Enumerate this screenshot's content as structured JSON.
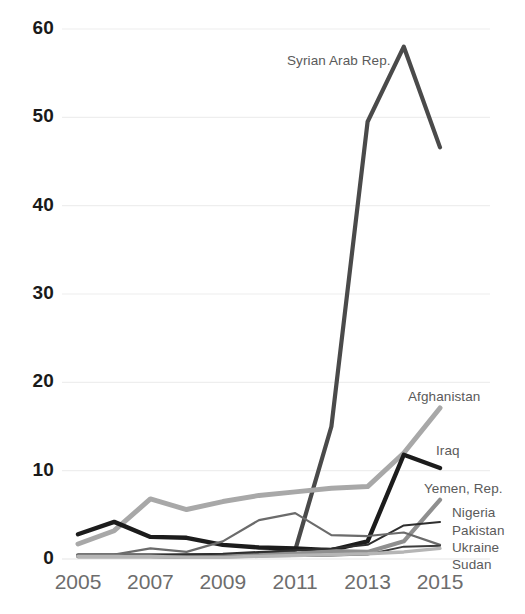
{
  "chart_data": {
    "type": "line",
    "title": "",
    "subtitle": "",
    "xlabel": "",
    "ylabel": "",
    "xlim": [
      2005,
      2015
    ],
    "ylim": [
      0,
      60
    ],
    "grid": true,
    "grid_axis": "y",
    "legend_position": "right-end-labels",
    "x": [
      2005,
      2006,
      2007,
      2008,
      2009,
      2010,
      2011,
      2012,
      2013,
      2014,
      2015
    ],
    "x_tick_labels": [
      "2005",
      "2007",
      "2009",
      "2011",
      "2013",
      "2015"
    ],
    "x_tick_values": [
      2005,
      2007,
      2009,
      2011,
      2013,
      2015
    ],
    "y_tick_labels": [
      "60",
      "50",
      "40",
      "30",
      "20",
      "10",
      "0"
    ],
    "y_tick_values": [
      60,
      50,
      40,
      30,
      20,
      10,
      0
    ],
    "series": [
      {
        "name": "Syrian Arab Rep.",
        "label": "Syrian Arab Rep.",
        "color": "#4a4a4a",
        "width": 4.2,
        "label_x": 287,
        "label_y": 53,
        "values": [
          0.4,
          0.4,
          0.4,
          0.4,
          0.4,
          0.5,
          1.0,
          15.0,
          49.5,
          58.0,
          46.6
        ]
      },
      {
        "name": "Afghanistan",
        "label": "Afghanistan",
        "color": "#a8a8a8",
        "width": 5.0,
        "label_x": 408,
        "label_y": 389,
        "values": [
          1.7,
          3.2,
          6.8,
          5.6,
          6.5,
          7.2,
          7.6,
          8.0,
          8.2,
          12.0,
          17.1
        ]
      },
      {
        "name": "Iraq",
        "label": "Iraq",
        "color": "#1c1c1c",
        "width": 4.4,
        "label_x": 436,
        "label_y": 443,
        "values": [
          2.8,
          4.2,
          2.5,
          2.4,
          1.6,
          1.3,
          1.2,
          1.0,
          2.0,
          11.8,
          10.3
        ]
      },
      {
        "name": "Yemen, Rep.",
        "label": "Yemen, Rep.",
        "color": "#8f8f8f",
        "width": 4.2,
        "label_x": 424,
        "label_y": 481,
        "values": [
          0.3,
          0.3,
          0.3,
          0.25,
          0.3,
          0.4,
          0.6,
          0.9,
          0.8,
          2.0,
          6.7
        ]
      },
      {
        "name": "Nigeria",
        "label": "Nigeria",
        "color": "#2e2e2e",
        "width": 2.0,
        "label_x": 452,
        "label_y": 505,
        "values": [
          0.35,
          0.4,
          0.4,
          0.5,
          0.6,
          0.8,
          1.0,
          1.2,
          1.6,
          3.8,
          4.2
        ]
      },
      {
        "name": "Pakistan",
        "label": "Pakistan",
        "color": "#6b6b6b",
        "width": 2.2,
        "label_x": 452,
        "label_y": 523,
        "values": [
          0.4,
          0.5,
          1.2,
          0.8,
          2.0,
          4.4,
          5.2,
          2.7,
          2.6,
          3.0,
          1.6
        ]
      },
      {
        "name": "Ukraine",
        "label": "Ukraine",
        "color": "#3c3c3c",
        "width": 2.0,
        "label_x": 452,
        "label_y": 540,
        "values": [
          0.25,
          0.25,
          0.25,
          0.3,
          0.3,
          0.3,
          0.35,
          0.4,
          0.5,
          1.4,
          1.5
        ]
      },
      {
        "name": "Sudan",
        "label": "Sudan",
        "color": "#b5b5b5",
        "width": 3.4,
        "label_x": 452,
        "label_y": 557,
        "values": [
          0.3,
          0.3,
          0.3,
          0.2,
          0.2,
          0.3,
          0.4,
          0.5,
          0.6,
          0.8,
          1.2
        ]
      }
    ]
  },
  "axis": {
    "gridline_color": "#eeeeee",
    "y_label_color": "#1a1a1a",
    "x_label_color": "#6d6d6d"
  }
}
